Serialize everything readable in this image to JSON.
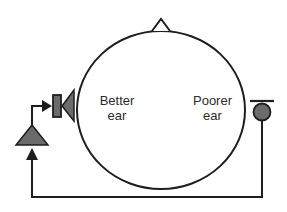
{
  "diagram": {
    "type": "CROS hearing aid routing schematic",
    "labels": {
      "better_ear_line1": "Better",
      "better_ear_line2": "ear",
      "poorer_ear_line1": "Poorer",
      "poorer_ear_line2": "ear"
    },
    "components": [
      {
        "id": "head",
        "shape": "ellipse",
        "description": "head outline (top view)"
      },
      {
        "id": "nose",
        "shape": "triangle",
        "description": "nose marker indicating facing direction"
      },
      {
        "id": "microphone",
        "shape": "circle-with-bar",
        "position": "poorer ear side"
      },
      {
        "id": "amplifier",
        "shape": "triangle",
        "position": "better ear side"
      },
      {
        "id": "receiver",
        "shape": "speaker",
        "position": "better ear side"
      }
    ],
    "connections": [
      {
        "from": "microphone",
        "to": "amplifier",
        "route": "wire around bottom of head"
      },
      {
        "from": "amplifier",
        "to": "receiver",
        "arrow": true
      }
    ],
    "colors": {
      "stroke": "#1e1e1e",
      "fill": "#6b6b6b",
      "background": "#ffffff"
    }
  }
}
